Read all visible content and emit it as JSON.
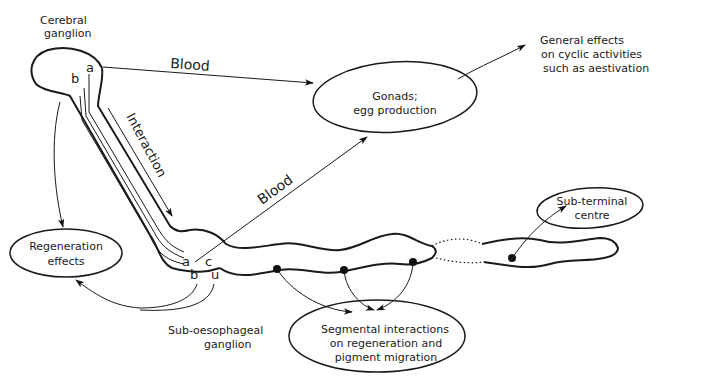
{
  "diagram": {
    "nodes": {
      "cerebral_ganglion": {
        "line1": "Cerebral",
        "line2": "ganglion"
      },
      "gonads": {
        "line1": "Gonads;",
        "line2": "egg production"
      },
      "general_effects": {
        "line1": "General effects",
        "line2": "on cyclic activities",
        "line3": "such as aestivation"
      },
      "regeneration": {
        "line1": "Regeneration",
        "line2": "effects"
      },
      "sub_terminal": {
        "line1": "Sub-terminal",
        "line2": "centre"
      },
      "sub_oesophageal": {
        "line1": "Sub-oesophageal",
        "line2": "ganglion"
      },
      "segmental": {
        "line1": "Segmental interactions",
        "line2": "on regeneration and",
        "line3": "pigment migration"
      }
    },
    "edge_labels": {
      "blood_top": "Blood",
      "blood_diag": "Blood",
      "interaction": "Interaction"
    },
    "cell_labels": {
      "cerebral_a": "a",
      "cerebral_b": "b",
      "sub_a": "a",
      "sub_b": "b",
      "sub_c": "c",
      "sub_u": "u"
    }
  }
}
